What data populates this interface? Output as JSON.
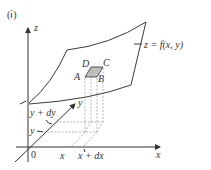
{
  "figure": {
    "panel_label": "(ⅰ)",
    "surface_label": "z = f(x,  y)",
    "axes": {
      "z_label": "z",
      "x_label": "x",
      "y_label": "y",
      "origin_label": "0"
    },
    "tick_labels": {
      "x": "x",
      "x_plus_dx": "x + dx",
      "y": "y",
      "y_plus_dy": "y + dy"
    },
    "patch_vertices": [
      "A",
      "B",
      "C",
      "D"
    ],
    "colors": {
      "line": "#333333",
      "patch_fill": "#bfbfbf",
      "dashed": "#888888"
    }
  }
}
